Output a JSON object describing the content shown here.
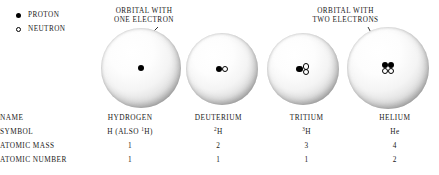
{
  "legend": {
    "items": [
      {
        "marker": "filled-circle-icon",
        "label": "PROTON"
      },
      {
        "marker": "open-circle-icon",
        "label": "NEUTRON"
      }
    ]
  },
  "annotations": [
    {
      "id": "one-electron",
      "line1": "ORBITAL WITH",
      "line2": "ONE ELECTRON"
    },
    {
      "id": "two-electrons",
      "line1": "ORBITAL WITH",
      "line2": "TWO ELECTRONS"
    }
  ],
  "atoms": [
    {
      "name": "HYDROGEN",
      "protons": 1,
      "neutrons": 0,
      "cx": 141,
      "cy": 68,
      "r": 40
    },
    {
      "name": "DEUTERIUM",
      "protons": 1,
      "neutrons": 1,
      "cx": 222,
      "cy": 69,
      "r": 36
    },
    {
      "name": "TRITIUM",
      "protons": 1,
      "neutrons": 2,
      "cx": 303,
      "cy": 69,
      "r": 36
    },
    {
      "name": "HELIUM",
      "protons": 2,
      "neutrons": 2,
      "cx": 388,
      "cy": 68,
      "r": 41
    }
  ],
  "table": {
    "row_labels": [
      "NAME",
      "SYMBOL",
      "ATOMIC MASS",
      "ATOMIC NUMBER"
    ],
    "columns": [
      {
        "name": "HYDROGEN",
        "symbol_prefix": "H (ALSO ",
        "symbol_superscript": "1",
        "symbol_element": "H",
        "symbol_suffix": ")",
        "atomic_mass": "1",
        "atomic_number": "1"
      },
      {
        "name": "DEUTERIUM",
        "symbol_prefix": "",
        "symbol_superscript": "2",
        "symbol_element": "H",
        "symbol_suffix": "",
        "atomic_mass": "2",
        "atomic_number": "1"
      },
      {
        "name": "TRITIUM",
        "symbol_prefix": "",
        "symbol_superscript": "3",
        "symbol_element": "H",
        "symbol_suffix": "",
        "atomic_mass": "3",
        "atomic_number": "1"
      },
      {
        "name": "HELIUM",
        "symbol_prefix": "",
        "symbol_superscript": "",
        "symbol_element": "He",
        "symbol_suffix": "",
        "atomic_mass": "4",
        "atomic_number": "2"
      }
    ]
  },
  "colors": {
    "ink": "#1a1a1a",
    "background": "#ffffff",
    "proton": "#000000",
    "neutron_fill": "#ffffff",
    "neutron_stroke": "#000000"
  }
}
